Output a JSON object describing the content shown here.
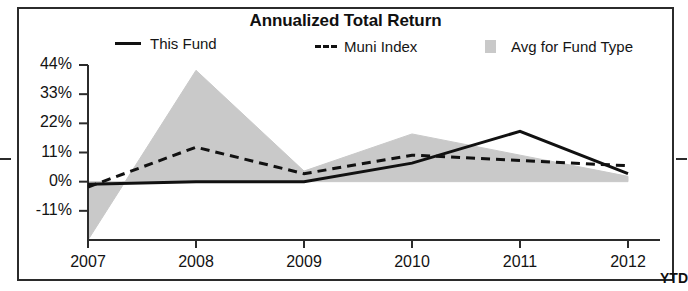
{
  "chart_data": {
    "type": "line",
    "title": "Annualized Total Return",
    "xlabel": "",
    "ylabel": "",
    "grid": false,
    "legend_position": "top",
    "x": [
      "2007",
      "2008",
      "2009",
      "2010",
      "2011",
      "2012"
    ],
    "x_tick_labels": [
      "2007",
      "2008",
      "2009",
      "2010",
      "2011",
      "2012"
    ],
    "x_axis_note": "YTD",
    "y_tick_labels": [
      "44%",
      "33%",
      "22%",
      "11%",
      "0%",
      "-11%"
    ],
    "y_tick_values": [
      44,
      33,
      22,
      11,
      0,
      -11
    ],
    "ylim": [
      -22,
      44
    ],
    "series": [
      {
        "name": "This Fund",
        "style": "solid",
        "color": "#111111",
        "values": [
          -1,
          0,
          0,
          7,
          19,
          3
        ]
      },
      {
        "name": "Muni Index",
        "style": "dashed",
        "color": "#111111",
        "values": [
          -2,
          13,
          3,
          10,
          8,
          6
        ]
      },
      {
        "name": "Avg for Fund Type",
        "style": "area",
        "color": "#c9c9c9",
        "values": [
          -22,
          42,
          4,
          18,
          10,
          2
        ]
      }
    ]
  },
  "legend": {
    "this_fund": "This Fund",
    "muni_index": "Muni Index",
    "avg_fund_type": "Avg for Fund Type",
    "swatch_this_fund": "solid-line-swatch-icon",
    "swatch_muni_index": "dashed-line-swatch-icon",
    "swatch_avg_fund": "area-fill-swatch-icon"
  },
  "axis": {
    "y_labels": [
      "44%",
      "33%",
      "22%",
      "11%",
      "0%",
      "-11%"
    ],
    "x_labels": [
      "2007",
      "2008",
      "2009",
      "2010",
      "2011",
      "2012"
    ],
    "ytd": "YTD"
  },
  "colors": {
    "line": "#111111",
    "area_fill": "#c9c9c9",
    "axis": "#2b2b2b",
    "frame": "#2b2b2b",
    "text": "#131313"
  }
}
